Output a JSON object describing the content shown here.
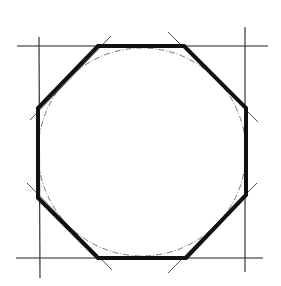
{
  "diagram": {
    "title": "",
    "colors": {
      "background": "#ffffff",
      "octagon": "#111111",
      "construction": "#222222",
      "circle": "#555555"
    },
    "construction_lines": [
      {
        "name": "top-horizontal",
        "x1": 17,
        "y1": 46,
        "x2": 268,
        "y2": 46
      },
      {
        "name": "bottom-horizontal",
        "x1": 16,
        "y1": 258,
        "x2": 263,
        "y2": 258
      },
      {
        "name": "left-vertical",
        "x1": 39,
        "y1": 37,
        "x2": 40,
        "y2": 278
      },
      {
        "name": "right-vertical",
        "x1": 245,
        "y1": 27,
        "x2": 245,
        "y2": 272
      }
    ],
    "diagonal_guides": [
      {
        "name": "top-left-diagonal",
        "x1": 30,
        "y1": 120,
        "x2": 111,
        "y2": 36
      },
      {
        "name": "top-right-diagonal",
        "x1": 168,
        "y1": 32,
        "x2": 258,
        "y2": 122
      },
      {
        "name": "bottom-left-diagonal",
        "x1": 27,
        "y1": 183,
        "x2": 112,
        "y2": 270
      },
      {
        "name": "bottom-right-diagonal",
        "x1": 168,
        "y1": 273,
        "x2": 257,
        "y2": 183
      }
    ],
    "octagon": {
      "points": "98,46 184,46 246,108 246,195 186,258 98,258 38,198 38,108",
      "stroke_width": 4
    },
    "circle": {
      "cx": 142,
      "cy": 152,
      "r": 104
    }
  }
}
